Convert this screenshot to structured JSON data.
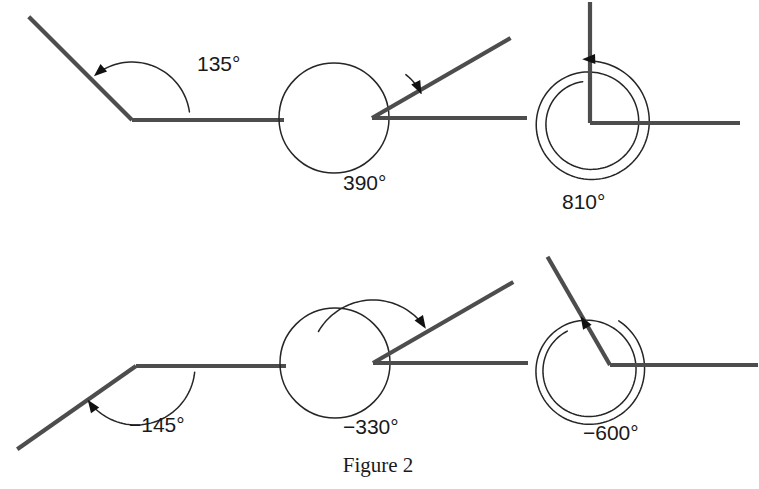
{
  "figure": {
    "caption": "Figure 2",
    "caption_x": 378,
    "caption_y": 472,
    "background_color": "#ffffff",
    "ray_color": "#4d4d4d",
    "arc_color": "#262626",
    "label_color": "#1a1a1a"
  },
  "diagrams": [
    {
      "id": "angle-135",
      "label": "135°",
      "label_x": 197,
      "label_y": 71,
      "vertex": [
        132,
        120
      ],
      "initial_ray_angle_deg": 0,
      "terminal_ray_angle_deg": 135,
      "rotation_deg": 135,
      "direction": "counterclockwise",
      "loops": 0,
      "initial_ray_length": 152,
      "terminal_ray_length": 146,
      "arc_radius": 58,
      "has_loop_circle": false
    },
    {
      "id": "angle-390",
      "label": "390°",
      "label_x": 343,
      "label_y": 190,
      "vertex": [
        372,
        118
      ],
      "initial_ray_angle_deg": 0,
      "terminal_ray_angle_deg": 30,
      "rotation_deg": 390,
      "direction": "counterclockwise",
      "loops": 1,
      "initial_ray_length": 155,
      "terminal_ray_length": 160,
      "arc_radius": 55,
      "has_loop_circle": true,
      "loop_center": [
        334,
        118
      ],
      "loop_radius": 55
    },
    {
      "id": "angle-810",
      "label": "810°",
      "label_x": 562,
      "label_y": 209,
      "vertex": [
        590,
        123
      ],
      "initial_ray_angle_deg": 0,
      "terminal_ray_angle_deg": 90,
      "rotation_deg": 810,
      "direction": "counterclockwise",
      "loops": 2,
      "initial_ray_length": 150,
      "terminal_ray_length": 121,
      "arc_radius": 62,
      "has_loop_circle": true,
      "loop_center": [
        590,
        123
      ],
      "loop_radius": 62
    },
    {
      "id": "angle-neg145",
      "label": "−145°",
      "label_x": 129,
      "label_y": 432,
      "vertex": [
        136,
        366
      ],
      "initial_ray_angle_deg": 0,
      "terminal_ray_angle_deg": -145,
      "rotation_deg": -145,
      "direction": "clockwise",
      "loops": 0,
      "initial_ray_length": 150,
      "terminal_ray_length": 145,
      "arc_radius": 59,
      "has_loop_circle": false
    },
    {
      "id": "angle-neg330",
      "label": "−330°",
      "label_x": 343,
      "label_y": 434,
      "vertex": [
        373,
        363
      ],
      "initial_ray_angle_deg": 0,
      "terminal_ray_angle_deg": 30,
      "rotation_deg": -330,
      "direction": "clockwise",
      "loops": 0,
      "initial_ray_length": 155,
      "terminal_ray_length": 162,
      "arc_radius": 55,
      "has_loop_circle": true,
      "loop_center": [
        335,
        363
      ],
      "loop_radius": 55
    },
    {
      "id": "angle-neg600",
      "label": "−600°",
      "label_x": 583,
      "label_y": 440,
      "vertex": [
        610,
        365
      ],
      "initial_ray_angle_deg": 0,
      "terminal_ray_angle_deg": 120,
      "rotation_deg": -600,
      "direction": "clockwise",
      "loops": 1,
      "initial_ray_length": 148,
      "terminal_ray_length": 125,
      "arc_radius": 55,
      "has_loop_circle": true,
      "loop_center": [
        588,
        370
      ],
      "loop_radius": 58
    }
  ]
}
